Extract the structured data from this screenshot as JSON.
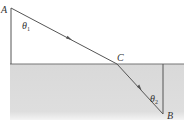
{
  "diagram": {
    "type": "refraction-ray-diagram",
    "points": {
      "A": {
        "label": "A",
        "x": 11,
        "y": 8
      },
      "C": {
        "label": "C",
        "x": 117,
        "y": 64
      },
      "B": {
        "label": "B",
        "x": 163,
        "y": 114
      }
    },
    "angles": {
      "theta1": {
        "symbol": "θ",
        "subscript": "1"
      },
      "theta2": {
        "symbol": "θ",
        "subscript": "2"
      }
    },
    "colors": {
      "medium_fill": "#dcdcdc",
      "lines": "#555555",
      "text": "#333333"
    }
  }
}
